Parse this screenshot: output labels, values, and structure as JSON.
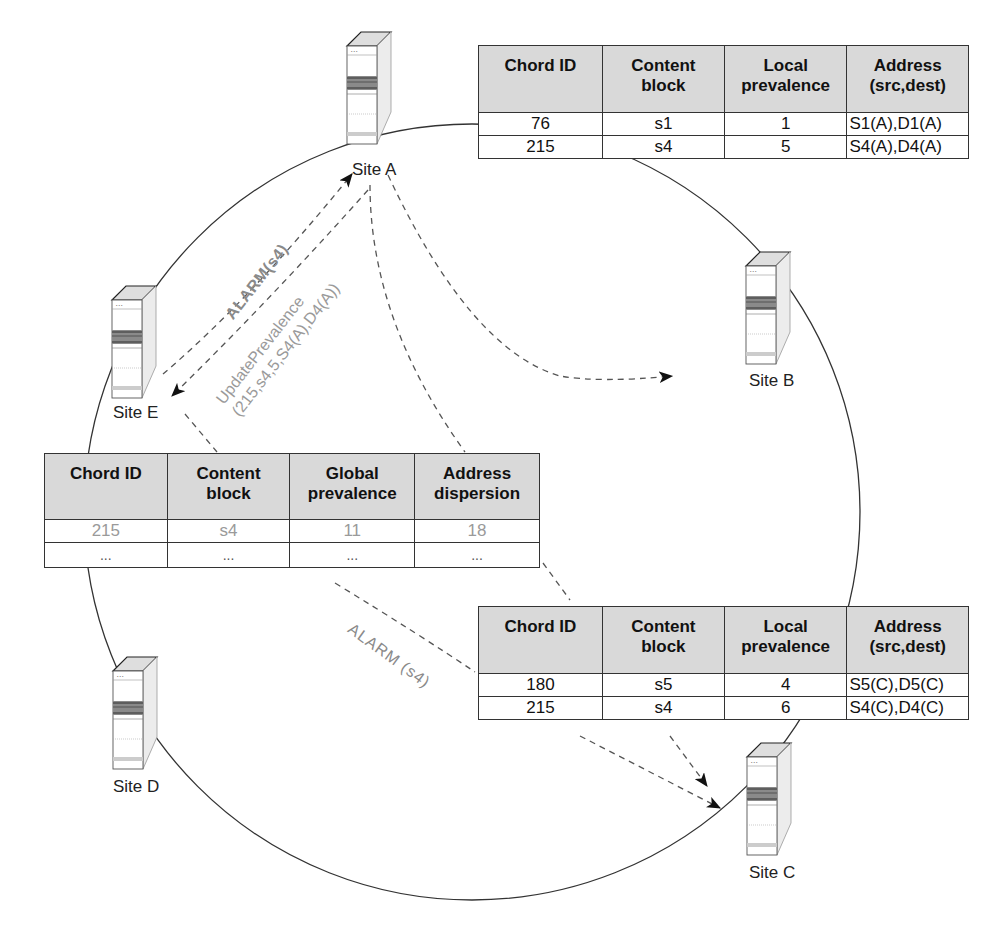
{
  "sites": [
    {
      "id": "A",
      "label": "Site A"
    },
    {
      "id": "B",
      "label": "Site B"
    },
    {
      "id": "C",
      "label": "Site C"
    },
    {
      "id": "D",
      "label": "Site D"
    },
    {
      "id": "E",
      "label": "Site E"
    }
  ],
  "table_site_a": {
    "headers": [
      "Chord ID",
      "Content block",
      "Local prevalence",
      "Address (src,dest)"
    ],
    "rows": [
      [
        "76",
        "s1",
        "1",
        "S1(A),D1(A)"
      ],
      [
        "215",
        "s4",
        "5",
        "S4(A),D4(A)"
      ]
    ]
  },
  "table_site_e": {
    "headers": [
      "Chord ID",
      "Content block",
      "Global prevalence",
      "Address dispersion"
    ],
    "rows": [
      [
        "215",
        "s4",
        "11",
        "18"
      ],
      [
        "...",
        "...",
        "...",
        "..."
      ]
    ]
  },
  "table_site_c": {
    "headers": [
      "Chord ID",
      "Content block",
      "Local prevalence",
      "Address (src,dest)"
    ],
    "rows": [
      [
        "180",
        "s5",
        "4",
        "S5(C),D5(C)"
      ],
      [
        "215",
        "s4",
        "6",
        "S4(C),D4(C)"
      ]
    ]
  },
  "messages": {
    "alarm_a_to_e": "ALARM(s4)",
    "update_line1": "UpdatePrevalence",
    "update_line2": "(215,s4,5,S4(A),D4(A))",
    "alarm_c": "ALARM (s4)"
  },
  "colors": {
    "header_fill": "#d9d9d9",
    "line": "#333333",
    "dashed": "#555555",
    "muted_text": "#9a9a9a"
  }
}
